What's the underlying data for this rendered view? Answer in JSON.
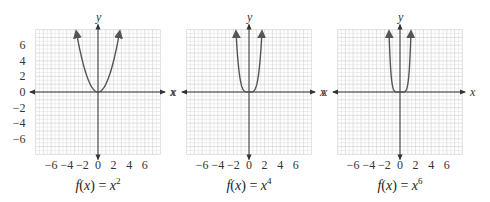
{
  "chart_data": [
    {
      "type": "line",
      "title": "f(x) = x^2",
      "caption": {
        "f": "f",
        "x": "x",
        "rhs_base": "x",
        "exponent": "2"
      },
      "xlabel": "x",
      "ylabel": "y",
      "xlim": [
        -8,
        8
      ],
      "ylim": [
        -8,
        8
      ],
      "xticks": [
        -6,
        -4,
        -2,
        0,
        2,
        4,
        6
      ],
      "yticks": [
        6,
        4,
        2,
        0,
        -2,
        -4,
        -6
      ],
      "grid": true,
      "series": [
        {
          "name": "f(x) = x^2",
          "exponent": 2,
          "x": [
            -2.7,
            -2,
            -1,
            0,
            1,
            2,
            2.7
          ],
          "y": [
            7.3,
            4,
            1,
            0,
            1,
            4,
            7.3
          ]
        }
      ]
    },
    {
      "type": "line",
      "title": "f(x) = x^4",
      "caption": {
        "f": "f",
        "x": "x",
        "rhs_base": "x",
        "exponent": "4"
      },
      "xlabel": "x",
      "ylabel": "y",
      "xlim": [
        -8,
        8
      ],
      "ylim": [
        -8,
        8
      ],
      "xticks": [
        -6,
        -4,
        -2,
        0,
        2,
        4,
        6
      ],
      "yticks": [],
      "grid": true,
      "series": [
        {
          "name": "f(x) = x^4",
          "exponent": 4,
          "x": [
            -1.65,
            -1.5,
            -1,
            0,
            1,
            1.5,
            1.65
          ],
          "y": [
            7.4,
            5.06,
            1,
            0,
            1,
            5.06,
            7.4
          ]
        }
      ]
    },
    {
      "type": "line",
      "title": "f(x) = x^6",
      "caption": {
        "f": "f",
        "x": "x",
        "rhs_base": "x",
        "exponent": "6"
      },
      "xlabel": "x",
      "ylabel": "y",
      "xlim": [
        -8,
        8
      ],
      "ylim": [
        -8,
        8
      ],
      "xticks": [
        -6,
        -4,
        -2,
        0,
        2,
        4,
        6
      ],
      "yticks": [],
      "grid": true,
      "series": [
        {
          "name": "f(x) = x^6",
          "exponent": 6,
          "x": [
            -1.4,
            -1.2,
            -1,
            0,
            1,
            1.2,
            1.4
          ],
          "y": [
            7.5,
            2.99,
            1,
            0,
            1,
            2.99,
            7.5
          ]
        }
      ]
    }
  ],
  "labels": {
    "x_axis": "x",
    "y_axis": "y",
    "equals": " = ",
    "open": "(",
    "close": ")"
  },
  "colors": {
    "curve": "#555555",
    "axis": "#333333",
    "grid_minor": "#e6e6e6",
    "grid_major": "#d2d2d2"
  }
}
